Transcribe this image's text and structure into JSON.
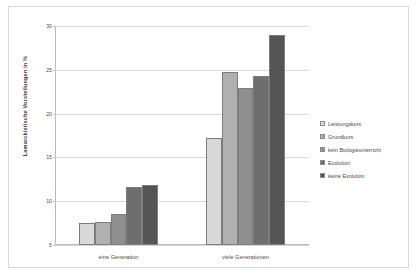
{
  "chart_data": {
    "type": "bar",
    "title": "",
    "xlabel": "",
    "ylabel": "Lamarckistische Vorstellungen in %",
    "categories": [
      "eine Generation",
      "viele Generationen"
    ],
    "ylim": [
      5,
      30
    ],
    "yticks": [
      5,
      10,
      15,
      20,
      25,
      30
    ],
    "grid": true,
    "legend_position": "right",
    "series": [
      {
        "name": "Leistungskurs",
        "color": "#d9d9d9",
        "values": [
          7.5,
          17.2
        ]
      },
      {
        "name": "Grundkurs",
        "color": "#b0b0b0",
        "values": [
          7.6,
          24.7
        ]
      },
      {
        "name": "kein Biologieunterricht",
        "color": "#8f8f8f",
        "values": [
          8.5,
          22.9
        ]
      },
      {
        "name": "Evolution",
        "color": "#6e6e6e",
        "values": [
          11.6,
          24.3
        ]
      },
      {
        "name": "keine Evolution",
        "color": "#555555",
        "values": [
          11.9,
          29.0
        ]
      }
    ]
  }
}
